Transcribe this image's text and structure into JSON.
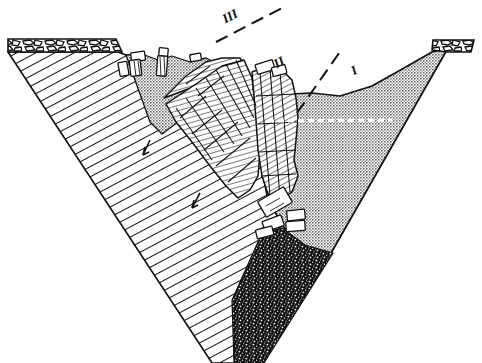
{
  "figure": {
    "width": 482,
    "height": 363,
    "background_color": "#ffffff",
    "line_color": "#111111"
  },
  "labels": [
    {
      "id": "label-III",
      "text": "III",
      "x": 232,
      "y": 20,
      "rotation": -28,
      "font_size": 13
    },
    {
      "id": "label-II",
      "text": "II",
      "x": 281,
      "y": 66,
      "rotation": -28,
      "font_size": 13
    },
    {
      "id": "label-I",
      "text": "I",
      "x": 356,
      "y": 74,
      "rotation": -28,
      "font_size": 13
    }
  ],
  "profile_lines": [
    {
      "id": "profile-line-III",
      "label": "III",
      "x1": 216,
      "y1": 41,
      "x2": 283,
      "y2": 7,
      "style": "dashed",
      "dash": "13 7"
    },
    {
      "id": "profile-line-II",
      "label": "II",
      "x1": 297,
      "y1": 112,
      "x2": 341,
      "y2": 49,
      "style": "dashed",
      "dash": "13 7"
    }
  ],
  "units": {
    "bedrock": {
      "name": "bedrock-hillside",
      "pattern": "diagonal-hatch",
      "description": "Hatched bedrock forming the left valley flank and valley floor",
      "fill": "#ffffff",
      "hatch_color": "#111111",
      "hatch_angle_deg": 62
    },
    "cap_layer_left": {
      "name": "surface-cap-left",
      "pattern": "irregular-breccia",
      "description": "Blocky / brecciated surface cap on left plateau",
      "fill": "#ffffff"
    },
    "cap_layer_right": {
      "name": "surface-cap-right",
      "pattern": "irregular-breccia",
      "description": "Blocky / brecciated surface cap on right plateau",
      "fill": "#ffffff"
    },
    "slide_mass": {
      "name": "rotated-slide-block",
      "pattern": "fine-line-jointed",
      "description": "Rotated, jointed rock slide mass with fine bedding lines",
      "fill": "#ffffff"
    },
    "talus_fill": {
      "name": "stippled-valley-fill",
      "pattern": "stipple",
      "description": "Stippled talus / colluvial valley fill",
      "fill": "#b8b8b8"
    },
    "gravel_deposit": {
      "name": "dark-gravel-deposit",
      "pattern": "coarse-speckle",
      "description": "Dark coarse gravel deposit at the valley bottom",
      "fill": "#141414"
    }
  },
  "detached_blocks": {
    "name": "detached-rock-blocks",
    "count": 11,
    "description": "Small tabular rock blocks detached from the slide mass"
  },
  "movement_arrows": [
    {
      "id": "arrow-upper",
      "x": 148,
      "y": 148,
      "direction": "down-slope"
    },
    {
      "id": "arrow-lower",
      "x": 194,
      "y": 200,
      "direction": "down-slope"
    }
  ],
  "water_table": {
    "name": "water-table-dashed-line",
    "description": "White dashed line across the stippled valley fill",
    "x1": 268,
    "y1": 121,
    "x2": 392,
    "y2": 120,
    "color": "#ffffff",
    "dash": "6 4"
  }
}
